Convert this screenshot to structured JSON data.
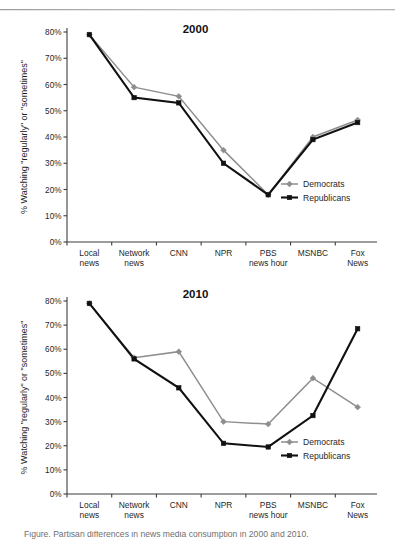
{
  "figure": {
    "top_rule": "horizontal-rule",
    "caption": "Figure. Partisan differences in news media consumption in 2000 and 2010."
  },
  "axis": {
    "ylabel": "% Watching \"regularly\" or \"sometimes\"",
    "yticks": [
      "0%",
      "10%",
      "20%",
      "30%",
      "40%",
      "50%",
      "60%",
      "70%",
      "80%"
    ],
    "ylim": [
      0,
      80
    ],
    "categories": [
      {
        "line1": "Local",
        "line2": "news"
      },
      {
        "line1": "Network",
        "line2": "news"
      },
      {
        "line1": "CNN",
        "line2": ""
      },
      {
        "line1": "NPR",
        "line2": ""
      },
      {
        "line1": "PBS",
        "line2": "news hour"
      },
      {
        "line1": "MSNBC",
        "line2": ""
      },
      {
        "line1": "Fox",
        "line2": "News"
      }
    ]
  },
  "legend": {
    "position": "inside-right",
    "entries": [
      {
        "label": "Democrats",
        "color": "#8e8e8e",
        "marker": "diamond"
      },
      {
        "label": "Republicans",
        "color": "#111111",
        "marker": "square"
      }
    ]
  },
  "chart_data": [
    {
      "type": "line",
      "title": "2000",
      "xlabel": "",
      "ylabel": "% Watching \"regularly\" or \"sometimes\"",
      "ylim": [
        0,
        80
      ],
      "grid": false,
      "legend_position": "inside-right",
      "categories": [
        "Local news",
        "Network news",
        "CNN",
        "NPR",
        "PBS news hour",
        "MSNBC",
        "Fox News"
      ],
      "series": [
        {
          "name": "Democrats",
          "color": "#8e8e8e",
          "marker": "diamond",
          "values": [
            79,
            59,
            55.5,
            35,
            18,
            40,
            46.5
          ]
        },
        {
          "name": "Republicans",
          "color": "#111111",
          "marker": "square",
          "values": [
            79,
            55,
            53,
            30,
            18,
            39,
            45.5
          ]
        }
      ]
    },
    {
      "type": "line",
      "title": "2010",
      "xlabel": "",
      "ylabel": "% Watching \"regularly\" or \"sometimes\"",
      "ylim": [
        0,
        80
      ],
      "grid": false,
      "legend_position": "inside-right",
      "categories": [
        "Local news",
        "Network news",
        "CNN",
        "NPR",
        "PBS news hour",
        "MSNBC",
        "Fox News"
      ],
      "series": [
        {
          "name": "Democrats",
          "color": "#8e8e8e",
          "marker": "diamond",
          "values": [
            79,
            56.5,
            59,
            30,
            29,
            48,
            36
          ]
        },
        {
          "name": "Republicans",
          "color": "#111111",
          "marker": "square",
          "values": [
            79,
            56,
            44,
            21,
            19.5,
            32.5,
            68.5
          ]
        }
      ]
    }
  ]
}
